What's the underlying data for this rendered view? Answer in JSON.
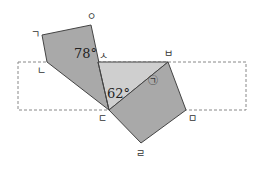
{
  "diagram": {
    "type": "geometry-folding",
    "colors": {
      "background": "#ffffff",
      "dark_fill": "#a9a9a9",
      "light_fill": "#cfcfcf",
      "stroke": "#444444",
      "dashed": "#888888"
    },
    "vertex_labels": {
      "giyeok": "ㄱ",
      "ieung": "ㅇ",
      "siot": "ㅅ",
      "nieun": "ㄴ",
      "digeut": "ㄷ",
      "bieup": "ㅂ",
      "mieum": "ㅁ",
      "rieul": "ㄹ"
    },
    "angles": {
      "angle_at_siot": "78°",
      "angle_at_digeut": "62°",
      "unknown_marker": "㉠"
    }
  }
}
